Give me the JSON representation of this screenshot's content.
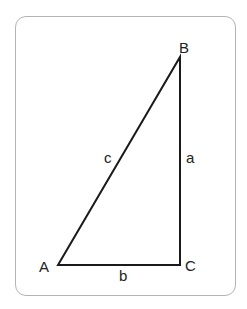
{
  "diagram": {
    "type": "right-triangle",
    "colors": {
      "stroke": "#1a1a1a",
      "frame": "#b4b4b4",
      "text": "#222222"
    },
    "vertices": {
      "A": {
        "label": "A",
        "x": 58,
        "y": 265
      },
      "B": {
        "label": "B",
        "x": 180,
        "y": 57
      },
      "C": {
        "label": "C",
        "x": 180,
        "y": 265
      }
    },
    "sides": {
      "a": {
        "label": "a",
        "from": "B",
        "to": "C"
      },
      "b": {
        "label": "b",
        "from": "A",
        "to": "C"
      },
      "c": {
        "label": "c",
        "from": "A",
        "to": "B"
      }
    },
    "right_angle_at": "C"
  }
}
